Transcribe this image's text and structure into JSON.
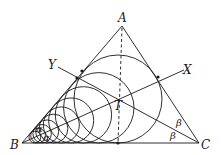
{
  "diagram": {
    "points": {
      "A": {
        "label": "A",
        "x": 122,
        "y": 24
      },
      "B": {
        "label": "B",
        "x": 22,
        "y": 143
      },
      "C": {
        "label": "C",
        "x": 199,
        "y": 143
      },
      "T": {
        "label": "T",
        "x": 118,
        "y": 98
      },
      "X": {
        "label": "X",
        "x": 186,
        "y": 70
      },
      "Y": {
        "label": "Y",
        "x": 56,
        "y": 67
      }
    },
    "angle_labels": {
      "alpha_upper": "α",
      "alpha_lower": "α",
      "beta_upper": "β",
      "beta_lower": "β"
    },
    "colors": {
      "stroke": "#1a1a1a",
      "background": "#ffffff"
    },
    "circle_chain": {
      "count": 10,
      "ratio": 0.8,
      "largest_radius": 44
    }
  }
}
